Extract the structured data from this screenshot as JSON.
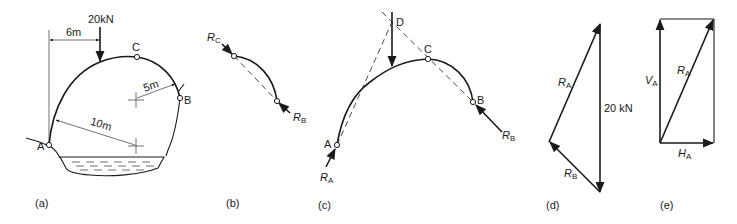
{
  "figure": {
    "panels": {
      "a": {
        "caption": "(a)",
        "load_label": "20kN",
        "dim_horizontal": "6m",
        "radius_small": "5m",
        "radius_large": "10m",
        "point_a": "A",
        "point_b": "B",
        "point_c": "C"
      },
      "b": {
        "caption": "(b)",
        "force_c": "R",
        "force_c_sub": "C",
        "force_b": "R",
        "force_b_sub": "B"
      },
      "c": {
        "caption": "(c)",
        "point_a": "A",
        "point_b": "B",
        "point_c": "C",
        "point_d": "D",
        "force_a": "R",
        "force_a_sub": "A",
        "force_b": "R",
        "force_b_sub": "B"
      },
      "d": {
        "caption": "(d)",
        "force_a": "R",
        "force_a_sub": "A",
        "force_b": "R",
        "force_b_sub": "B",
        "load_label": "20 kN"
      },
      "e": {
        "caption": "(e)",
        "vertical": "V",
        "vertical_sub": "A",
        "resultant": "R",
        "resultant_sub": "A",
        "horizontal": "H",
        "horizontal_sub": "A"
      }
    }
  }
}
